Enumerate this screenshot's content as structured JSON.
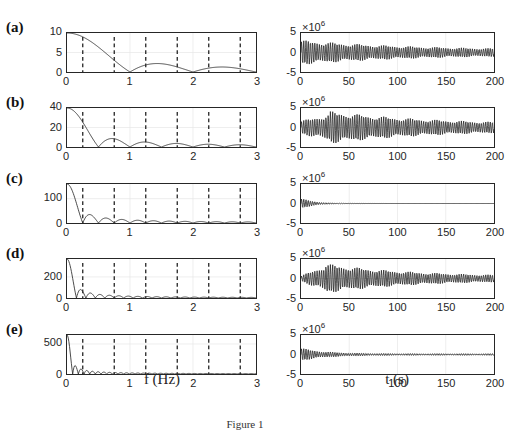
{
  "figure": {
    "caption": "Figure 1",
    "left_xlabel": "f (Hz)",
    "right_xlabel": "t (s)",
    "right_exponent": "×10",
    "right_exponent_power": "6"
  },
  "panels": [
    {
      "label": "(a)",
      "left_yticks": [
        "10",
        "5",
        "0"
      ],
      "left_ymax": 10
    },
    {
      "label": "(b)",
      "left_yticks": [
        "40",
        "20",
        "0"
      ],
      "left_ymax": 40
    },
    {
      "label": "(c)",
      "left_yticks": [
        "100",
        "0"
      ],
      "left_ymax": 160
    },
    {
      "label": "(d)",
      "left_yticks": [
        "200",
        "0"
      ],
      "left_ymax": 370
    },
    {
      "label": "(e)",
      "left_yticks": [
        "500",
        "0"
      ],
      "left_ymax": 650
    }
  ],
  "left_xticks": [
    "0",
    "1",
    "2",
    "3"
  ],
  "right_xticks": [
    "0",
    "50",
    "100",
    "150",
    "200"
  ],
  "right_yticks": [
    "5",
    "0",
    "-5"
  ],
  "chart_data": [
    {
      "type": "line",
      "panel": "(a)",
      "title": "",
      "xlabel": "f (Hz)",
      "ylabel": "",
      "xlim": [
        0,
        3
      ],
      "ylim": [
        0,
        10
      ],
      "grid": true,
      "x": [
        0,
        0.25,
        0.5,
        0.75,
        1.0,
        1.25,
        1.5,
        1.75,
        2.0,
        2.25,
        2.5,
        2.75,
        3.0
      ],
      "values": [
        10,
        9.0,
        6.4,
        3.0,
        0,
        1.8,
        2.1,
        1.2,
        0,
        1.0,
        1.3,
        0.9,
        0
      ],
      "vertical_dashed_lines_x": [
        0.25,
        0.75,
        1.25,
        1.75,
        2.25,
        2.75
      ]
    },
    {
      "type": "line",
      "panel": "(a)",
      "xlabel": "t (s)",
      "ylabel": "",
      "y_scale_exponent": "x10^6",
      "xlim": [
        0,
        200
      ],
      "ylim": [
        -5,
        5
      ],
      "grid": true,
      "description": "oscillation amplitude ~2.5e6 early, decaying to ~1e6 by t=200"
    },
    {
      "type": "line",
      "panel": "(b)",
      "xlabel": "f (Hz)",
      "xlim": [
        0,
        3
      ],
      "ylim": [
        0,
        40
      ],
      "grid": true,
      "x": [
        0,
        0.25,
        0.5,
        0.75,
        1.0,
        1.25,
        1.5,
        1.75,
        2.0,
        2.25,
        2.5,
        2.75,
        3.0
      ],
      "values": [
        40,
        26,
        0,
        8.5,
        0,
        5,
        0,
        3.5,
        0,
        2.8,
        0,
        2.3,
        0
      ],
      "vertical_dashed_lines_x": [
        0.25,
        0.75,
        1.25,
        1.75,
        2.25,
        2.75
      ]
    },
    {
      "type": "line",
      "panel": "(b)",
      "xlabel": "t (s)",
      "y_scale_exponent": "x10^6",
      "xlim": [
        0,
        200
      ],
      "ylim": [
        -5,
        5
      ],
      "grid": true,
      "description": "oscillation amplitude ~3e6 around t=25, ~1.5e6 later"
    },
    {
      "type": "line",
      "panel": "(c)",
      "xlabel": "f (Hz)",
      "xlim": [
        0,
        3
      ],
      "ylim": [
        0,
        160
      ],
      "grid": true,
      "x": [
        0,
        0.25,
        0.375,
        0.5,
        0.625,
        0.75,
        0.875,
        1.0,
        1.5,
        2.0,
        3.0
      ],
      "values": [
        160,
        5,
        35,
        0,
        22,
        0,
        14,
        0,
        6,
        4,
        2
      ],
      "vertical_dashed_lines_x": [
        0.25,
        0.75,
        1.25,
        1.75,
        2.25,
        2.75
      ]
    },
    {
      "type": "line",
      "panel": "(c)",
      "xlabel": "t (s)",
      "y_scale_exponent": "x10^6",
      "xlim": [
        0,
        200
      ],
      "ylim": [
        -5,
        5
      ],
      "grid": true,
      "description": "brief oscillation ~1e6 near t<40, decays to ~0"
    },
    {
      "type": "line",
      "panel": "(d)",
      "xlabel": "f (Hz)",
      "xlim": [
        0,
        3
      ],
      "ylim": [
        0,
        370
      ],
      "grid": true,
      "x": [
        0,
        0.15,
        0.25,
        0.35,
        0.45,
        0.55,
        0.65,
        0.75,
        1.0,
        2.0,
        3.0
      ],
      "values": [
        370,
        0,
        80,
        0,
        50,
        0,
        35,
        0,
        20,
        8,
        4
      ],
      "vertical_dashed_lines_x": [
        0.25,
        0.75,
        1.25,
        1.75,
        2.25,
        2.75
      ]
    },
    {
      "type": "line",
      "panel": "(d)",
      "xlabel": "t (s)",
      "y_scale_exponent": "x10^6",
      "xlim": [
        0,
        200
      ],
      "ylim": [
        -5,
        5
      ],
      "grid": true,
      "description": "oscillation amplitude ~3e6 around t=20-50, ~1e6 by t=200"
    },
    {
      "type": "line",
      "panel": "(e)",
      "xlabel": "f (Hz)",
      "xlim": [
        0,
        3
      ],
      "ylim": [
        0,
        650
      ],
      "grid": true,
      "x": [
        0,
        0.1,
        0.18,
        0.26,
        0.34,
        0.42,
        0.5,
        1.0,
        2.0,
        3.0
      ],
      "values": [
        650,
        0,
        130,
        80,
        60,
        50,
        40,
        20,
        8,
        4
      ],
      "vertical_dashed_lines_x": [
        0.25,
        0.75,
        1.25,
        1.75,
        2.25,
        2.75
      ]
    },
    {
      "type": "line",
      "panel": "(e)",
      "xlabel": "t (s)",
      "y_scale_exponent": "x10^6",
      "xlim": [
        0,
        200
      ],
      "ylim": [
        -5,
        5
      ],
      "grid": true,
      "description": "oscillation ~1.2e6 early (t<30), decaying to ~0.3e6"
    }
  ]
}
